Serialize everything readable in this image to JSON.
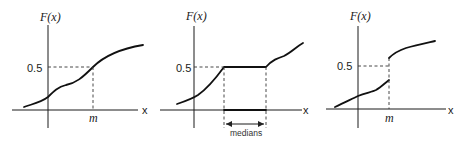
{
  "panels": [
    {
      "id": "continuous",
      "y_label": "F(x)",
      "x_label": "x",
      "level_label": "0.5",
      "marker_label": "m"
    },
    {
      "id": "flat-segment",
      "y_label": "F(x)",
      "x_label": "x",
      "level_label": "0.5",
      "range_label": "medians"
    },
    {
      "id": "jump",
      "y_label": "F(x)",
      "x_label": "x",
      "level_label": "0.5",
      "marker_label": "m"
    }
  ]
}
